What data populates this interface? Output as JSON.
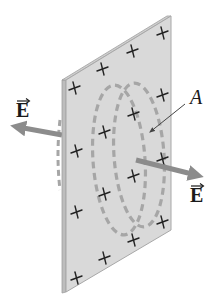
{
  "figure": {
    "labels": {
      "field_left": "E",
      "field_right": "E",
      "area": "A"
    },
    "charge_symbol": "+",
    "charge_count": 16,
    "colors": {
      "plate_face": "#d9d9d9",
      "plate_edge": "#a8a8a8",
      "gaussian_surface": "#a6a6a6",
      "field_arrow": "#8c8c8c",
      "text": "#1a1a1a"
    }
  }
}
